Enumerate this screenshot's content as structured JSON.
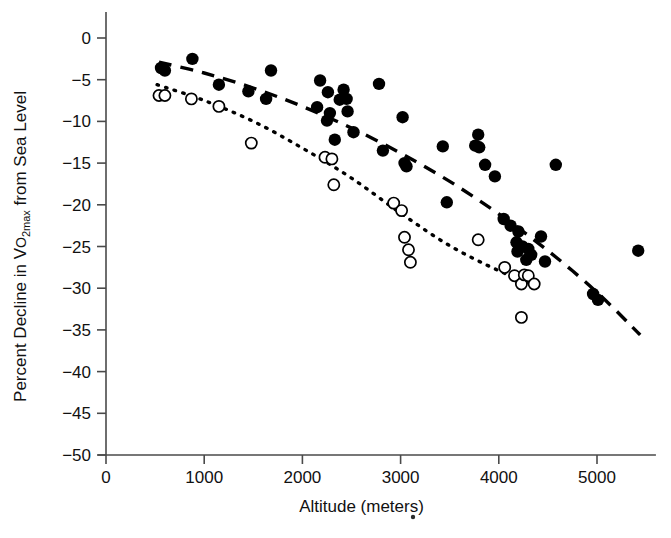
{
  "chart_data": {
    "type": "scatter",
    "title": "",
    "xlabel": "Altitude (meters)",
    "ylabel_parts": {
      "lead": "Percent Decline in V",
      "o_small": "O",
      "sub": "2max",
      "tail": " from Sea Level"
    },
    "ylabel": "Percent Decline in VO2max from Sea Level",
    "xlim": [
      0,
      5600
    ],
    "ylim": [
      -50,
      0
    ],
    "xticks": [
      0,
      1000,
      2000,
      3000,
      4000,
      5000
    ],
    "xtick_labels": [
      "0",
      "1000",
      "2000",
      "3000",
      "4000",
      "5000"
    ],
    "yticks": [
      0,
      -5,
      -10,
      -15,
      -20,
      -25,
      -30,
      -35,
      -40,
      -45,
      -50
    ],
    "ytick_labels": [
      "0",
      "−5",
      "−10",
      "−15",
      "−20",
      "−25",
      "−30",
      "−35",
      "−40",
      "−45",
      "−50"
    ],
    "grid": false,
    "legend": "none",
    "marker_colors": {
      "filled": "#000000",
      "open_fill": "#ffffff",
      "open_stroke": "#000000",
      "fit_line": "#000000",
      "axis": "#4a4a4a"
    },
    "series": [
      {
        "name": "filled-circles",
        "marker": "filled-circle",
        "points": [
          [
            560,
            -3.6
          ],
          [
            600,
            -3.9
          ],
          [
            880,
            -2.5
          ],
          [
            1150,
            -5.6
          ],
          [
            1450,
            -6.4
          ],
          [
            1630,
            -7.3
          ],
          [
            1680,
            -3.9
          ],
          [
            2150,
            -8.3
          ],
          [
            2180,
            -5.1
          ],
          [
            2250,
            -9.9
          ],
          [
            2260,
            -6.5
          ],
          [
            2280,
            -9.0
          ],
          [
            2330,
            -12.2
          ],
          [
            2380,
            -7.4
          ],
          [
            2420,
            -6.2
          ],
          [
            2450,
            -7.3
          ],
          [
            2460,
            -8.8
          ],
          [
            2520,
            -11.3
          ],
          [
            2780,
            -5.5
          ],
          [
            2820,
            -13.5
          ],
          [
            3020,
            -9.5
          ],
          [
            3040,
            -15.0
          ],
          [
            3060,
            -15.4
          ],
          [
            3430,
            -13.0
          ],
          [
            3470,
            -19.7
          ],
          [
            3760,
            -12.9
          ],
          [
            3790,
            -11.6
          ],
          [
            3800,
            -13.1
          ],
          [
            3860,
            -15.2
          ],
          [
            3960,
            -16.6
          ],
          [
            4050,
            -21.7
          ],
          [
            4120,
            -22.5
          ],
          [
            4180,
            -24.5
          ],
          [
            4190,
            -25.6
          ],
          [
            4200,
            -23.2
          ],
          [
            4240,
            -25.0
          ],
          [
            4280,
            -26.6
          ],
          [
            4300,
            -25.3
          ],
          [
            4330,
            -26.0
          ],
          [
            4430,
            -23.8
          ],
          [
            4470,
            -26.8
          ],
          [
            4580,
            -15.2
          ],
          [
            4960,
            -30.7
          ],
          [
            5010,
            -31.4
          ],
          [
            5420,
            -25.5
          ]
        ]
      },
      {
        "name": "open-circles",
        "marker": "open-circle",
        "points": [
          [
            540,
            -6.9
          ],
          [
            600,
            -6.9
          ],
          [
            870,
            -7.3
          ],
          [
            1150,
            -8.2
          ],
          [
            1480,
            -12.6
          ],
          [
            2230,
            -14.3
          ],
          [
            2300,
            -14.5
          ],
          [
            2320,
            -17.6
          ],
          [
            2930,
            -19.8
          ],
          [
            3010,
            -20.7
          ],
          [
            3040,
            -23.9
          ],
          [
            3080,
            -25.4
          ],
          [
            3100,
            -26.9
          ],
          [
            3790,
            -24.2
          ],
          [
            4060,
            -27.5
          ],
          [
            4160,
            -28.5
          ],
          [
            4230,
            -29.5
          ],
          [
            4260,
            -28.4
          ],
          [
            4300,
            -28.5
          ],
          [
            4360,
            -29.5
          ],
          [
            4230,
            -33.5
          ]
        ]
      }
    ],
    "fits": [
      {
        "name": "filled-fit",
        "style": "dashed",
        "points": [
          [
            540,
            -2.9
          ],
          [
            1000,
            -4.2
          ],
          [
            1500,
            -6.0
          ],
          [
            2000,
            -8.2
          ],
          [
            2500,
            -10.8
          ],
          [
            3000,
            -13.8
          ],
          [
            3500,
            -17.2
          ],
          [
            4000,
            -21.1
          ],
          [
            4500,
            -25.5
          ],
          [
            5000,
            -30.5
          ],
          [
            5440,
            -35.6
          ]
        ]
      },
      {
        "name": "open-fit",
        "style": "dotted",
        "points": [
          [
            520,
            -5.6
          ],
          [
            1000,
            -7.5
          ],
          [
            1500,
            -10.0
          ],
          [
            2000,
            -13.2
          ],
          [
            2500,
            -16.8
          ],
          [
            3000,
            -21.0
          ],
          [
            3500,
            -24.9
          ],
          [
            4000,
            -27.9
          ],
          [
            4400,
            -29.8
          ]
        ]
      }
    ],
    "stray_mark": {
      "x": 413,
      "y": 517,
      "r": 2.2
    }
  }
}
